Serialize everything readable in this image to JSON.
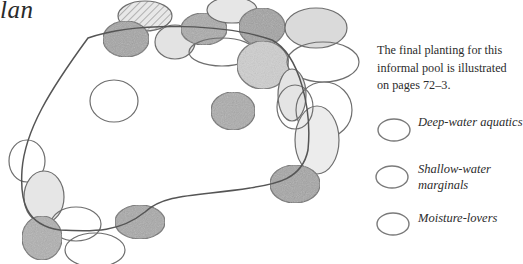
{
  "title": {
    "text": "lan"
  },
  "caption": {
    "text": "The final planting for this informal pool is illustrated on pages 72–3."
  },
  "legend": {
    "items": [
      {
        "label": "Deep-water aquatics",
        "symbol": "oval-outline"
      },
      {
        "label": "Shallow-water marginals",
        "symbol": "oval-outline"
      },
      {
        "label": "Moisture-lovers",
        "symbol": "oval-outline"
      }
    ]
  },
  "colors": {
    "outline": "#6e6e6e",
    "pool_edge": "#555555",
    "shade_dark": "#9c9c9c",
    "shade_mid": "#c4c4c4",
    "shade_light": "#e4e4e4",
    "text": "#2c2c2c"
  }
}
